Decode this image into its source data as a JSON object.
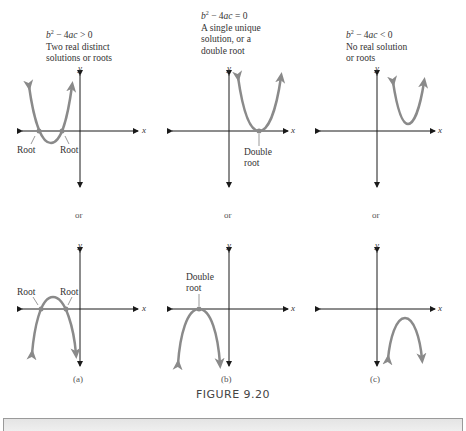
{
  "figure": {
    "caption": "FIGURE 9.20",
    "columns": [
      {
        "id": "a",
        "condition": "b² − 4ac > 0",
        "description_lines": [
          "Two real distinct",
          "solutions or roots"
        ],
        "top_graph": {
          "opens": "up",
          "root_labels": [
            "Root",
            "Root"
          ]
        },
        "separator": "or",
        "bottom_graph": {
          "opens": "down",
          "root_labels": [
            "Root",
            "Root"
          ]
        },
        "sublabel": "(a)"
      },
      {
        "id": "b",
        "condition": "b² − 4ac = 0",
        "description_lines": [
          "A single unique",
          "solution, or a",
          "double root"
        ],
        "top_graph": {
          "opens": "up",
          "root_label_lines": [
            "Double",
            "root"
          ]
        },
        "separator": "or",
        "bottom_graph": {
          "opens": "down",
          "root_label_lines": [
            "Double",
            "root"
          ]
        },
        "sublabel": "(b)"
      },
      {
        "id": "c",
        "condition": "b² − 4ac < 0",
        "description_lines": [
          "No real solution",
          "or roots"
        ],
        "top_graph": {
          "opens": "up"
        },
        "separator": "or",
        "bottom_graph": {
          "opens": "down"
        },
        "sublabel": "(c)"
      }
    ],
    "axis_labels": {
      "x": "x",
      "y": "y"
    },
    "colors": {
      "curve": "#8a8a8a",
      "axis": "#1a1a1a",
      "text": "#333333"
    }
  }
}
